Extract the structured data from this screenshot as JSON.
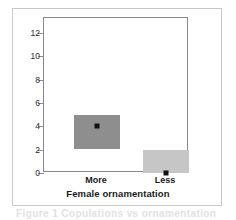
{
  "chart_data": {
    "type": "bar",
    "title": "",
    "xlabel": "Female ornamentation",
    "ylabel": "Number of copulations",
    "categories": [
      "More",
      "Less"
    ],
    "values": [
      4,
      0
    ],
    "ylim": [
      0,
      13.3
    ],
    "xtick_labels": [
      "More",
      "Less"
    ],
    "ytick_labels": [
      "0",
      "2",
      "4",
      "6",
      "8",
      "10",
      "12"
    ],
    "ytick_values": [
      0,
      2,
      4,
      6,
      8,
      10,
      12
    ],
    "grid": false,
    "legend": "none",
    "series": [
      {
        "name": "Number of copulations",
        "boxes": [
          {
            "category": "More",
            "box_low": 2.1,
            "box_high": 5.0,
            "point": 4,
            "fill": "#8e8e8e"
          },
          {
            "category": "Less",
            "box_low": 0,
            "box_high": 2.0,
            "point": 0,
            "fill": "#c6c6c6"
          }
        ]
      }
    ]
  },
  "figure": {
    "caption_sliver": "Figure 1  Copulations vs ornamentation"
  },
  "colors": {
    "box_dark": "#8e8e8e",
    "box_light": "#c6c6c6",
    "marker": "#111111",
    "axis": "#888888",
    "frame": "#c9c9c9",
    "text": "#1a1a1a"
  }
}
